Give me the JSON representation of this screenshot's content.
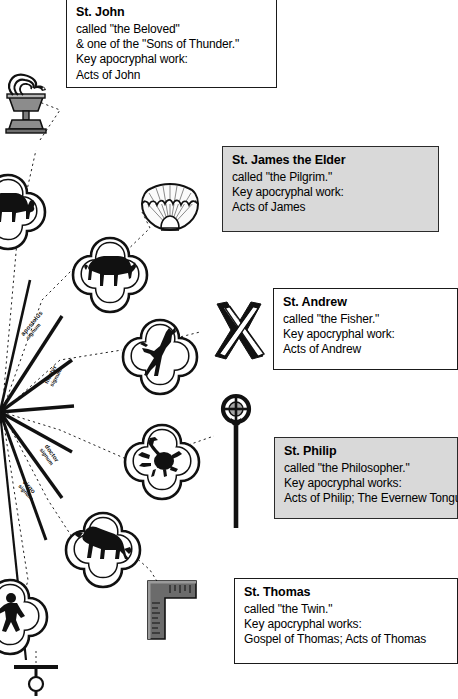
{
  "page": {
    "width": 458,
    "height": 699,
    "background": "#ffffff",
    "ink": "#1a1a1a",
    "shade": "#d9d9d9"
  },
  "cards": [
    {
      "id": "john",
      "name": "St. John",
      "shaded": false,
      "lines": [
        "called \"the Beloved\"",
        "& one of the \"Sons of Thunder.\"",
        "Key apocryphal work:",
        "Acts of John"
      ]
    },
    {
      "id": "james",
      "name": "St. James the Elder",
      "shaded": true,
      "lines": [
        "called \"the Pilgrim.\"",
        "Key apocryphal work:",
        "Acts of James"
      ]
    },
    {
      "id": "andrew",
      "name": "St. Andrew",
      "shaded": false,
      "lines": [
        "called \"the Fisher.\"",
        "Key apocryphal work:",
        "Acts of Andrew"
      ]
    },
    {
      "id": "philip",
      "name": "St. Philip",
      "shaded": true,
      "lines": [
        "called \"the Philosopher.\"",
        "Key apocryphal works:",
        "Acts of Philip; The Evernew Tongue"
      ]
    },
    {
      "id": "thomas",
      "name": "St. Thomas",
      "shaded": false,
      "lines": [
        "called \"the Twin.\"",
        "Key apocryphal works:",
        "Gospel of Thomas; Acts of Thomas"
      ]
    }
  ],
  "symbols": [
    {
      "id": "chalice",
      "label": "chalice-with-serpent-icon",
      "for": "St. John"
    },
    {
      "id": "shell",
      "label": "scallop-shell-icon",
      "for": "St. James the Elder"
    },
    {
      "id": "saltire",
      "label": "saltire-cross-icon",
      "for": "St. Andrew"
    },
    {
      "id": "staff",
      "label": "cross-staff-icon",
      "for": "St. Philip"
    },
    {
      "id": "square",
      "label": "carpenters-square-icon",
      "for": "St. Thomas"
    }
  ],
  "medallions": [
    {
      "id": "aries",
      "label": "ram-medallion-icon",
      "clipped": true
    },
    {
      "id": "taurus",
      "label": "bull-medallion-icon",
      "clipped": false
    },
    {
      "id": "capricorn",
      "label": "goat-medallion-icon",
      "clipped": false
    },
    {
      "id": "scorpio",
      "label": "scorpion-medallion-icon",
      "clipped": false
    },
    {
      "id": "leo",
      "label": "lion-medallion-icon",
      "clipped": false
    },
    {
      "id": "virgo",
      "label": "figure-medallion-icon",
      "clipped": true
    }
  ],
  "spoke_labels": [
    {
      "id": "spoke-1",
      "main": "apostolus",
      "sub": "signum"
    },
    {
      "id": "spoke-2",
      "main": "martyr",
      "sub": "signum"
    },
    {
      "id": "spoke-3",
      "main": "doctor",
      "sub": "signum"
    },
    {
      "id": "spoke-4",
      "main": "virgo",
      "sub": "signum"
    }
  ],
  "hub": {
    "id": "radiating-hub",
    "label": "radial-spokes-hub",
    "spoke_count": 8
  },
  "bottom_marker": {
    "id": "tau-marker",
    "label": "tau-staff-icon"
  }
}
